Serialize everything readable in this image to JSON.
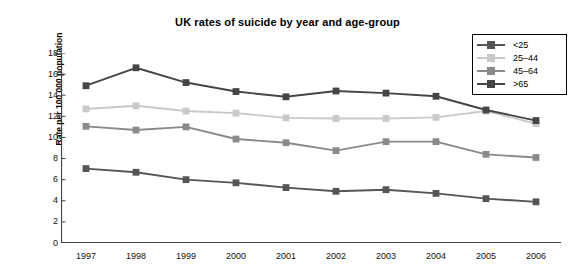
{
  "chart_data": {
    "type": "line",
    "title": "UK rates of suicide by year and age-group",
    "xlabel": "",
    "ylabel": "Rate per 100 000 population",
    "categories": [
      "1997",
      "1998",
      "1999",
      "2000",
      "2001",
      "2002",
      "2003",
      "2004",
      "2005",
      "2006"
    ],
    "ylim": [
      0,
      18
    ],
    "ytick_step": 2,
    "yticks": [
      "18",
      "16",
      "14",
      "12",
      "10",
      "8",
      "6",
      "4",
      "2",
      "0"
    ],
    "grid": false,
    "legend_position": "top-right",
    "series": [
      {
        "name": "<25",
        "color": "#555555",
        "values": [
          7.05,
          6.7,
          6.0,
          5.7,
          5.25,
          4.9,
          5.05,
          4.7,
          4.2,
          3.9
        ]
      },
      {
        "name": "25–44",
        "color": "#c9c9c9",
        "values": [
          12.7,
          13.0,
          12.5,
          12.3,
          11.85,
          11.8,
          11.8,
          11.9,
          12.5,
          11.3
        ]
      },
      {
        "name": "45–64",
        "color": "#8a8a8a",
        "values": [
          11.05,
          10.7,
          11.0,
          9.85,
          9.5,
          8.75,
          9.6,
          9.6,
          8.4,
          8.1
        ]
      },
      {
        "name": ">65",
        "color": "#454545",
        "values": [
          14.9,
          16.6,
          15.2,
          14.35,
          13.85,
          14.4,
          14.2,
          13.9,
          12.6,
          11.6
        ]
      }
    ]
  }
}
